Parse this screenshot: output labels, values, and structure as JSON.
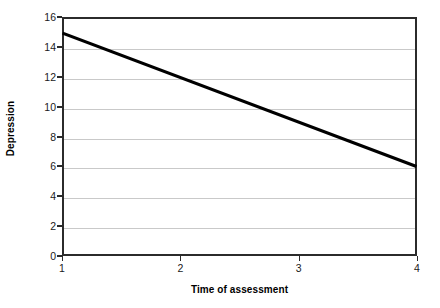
{
  "chart_data": {
    "type": "line",
    "title": "",
    "xlabel": "Time of assessment",
    "ylabel": "Depression",
    "x": [
      1,
      4
    ],
    "values": [
      15,
      6
    ],
    "series": [
      {
        "name": "Depression",
        "x": [
          1,
          4
        ],
        "values": [
          15,
          6
        ]
      }
    ],
    "xlim": [
      1,
      4
    ],
    "ylim": [
      0,
      16
    ],
    "xticks": [
      "1",
      "2",
      "3",
      "4"
    ],
    "yticks": [
      "0",
      "2",
      "4",
      "6",
      "8",
      "10",
      "12",
      "14",
      "16"
    ],
    "xtick_values": [
      1,
      2,
      3,
      4
    ],
    "ytick_values": [
      0,
      2,
      4,
      6,
      8,
      10,
      12,
      14,
      16
    ],
    "grid": "horizontal",
    "legend": "none",
    "line_color": "#000000",
    "grid_color": "#c9c9c9",
    "axis_color": "#2b2b2b",
    "background_color": "#ffffff"
  }
}
